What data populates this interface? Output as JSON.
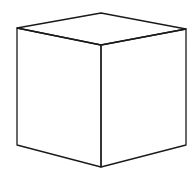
{
  "diagram": {
    "type": "cube-line-drawing",
    "stroke_color": "#1a1a1a",
    "background": "#ffffff",
    "vertices": {
      "top_back": [
        101,
        13
      ],
      "top_left": [
        17,
        28
      ],
      "top_right": [
        186,
        29
      ],
      "top_front": [
        101,
        45
      ],
      "bottom_left": [
        17,
        145
      ],
      "bottom_front": [
        101,
        167
      ],
      "bottom_right": [
        186,
        145
      ]
    },
    "faces": [
      "top",
      "left",
      "right"
    ]
  }
}
